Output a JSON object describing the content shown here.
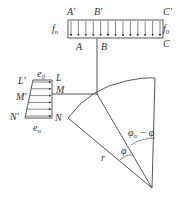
{
  "diagram": {
    "type": "mechanics-schematic",
    "top_load": {
      "labels_top": [
        "A'",
        "B'",
        "C'"
      ],
      "labels_bottom": [
        "A",
        "B",
        "C"
      ],
      "left_intensity": "f",
      "left_intensity_sub": "n",
      "right_intensity": "f",
      "right_intensity_sub": "0",
      "arrow_count": 13
    },
    "side_load": {
      "labels_left": [
        "L'",
        "M'",
        "N'"
      ],
      "labels_right": [
        "L",
        "M",
        "N"
      ],
      "top_intensity": "e",
      "top_intensity_sub": "0",
      "bottom_intensity": "e",
      "bottom_intensity_sub": "n",
      "arrow_count": 6
    },
    "sector": {
      "radius_label": "r",
      "angle_label": "φ",
      "complement_angle_label": "φn − φ",
      "complement_angle_main": "φ",
      "complement_angle_sub": "n",
      "complement_angle_rest": " − φ"
    },
    "caption": ""
  }
}
